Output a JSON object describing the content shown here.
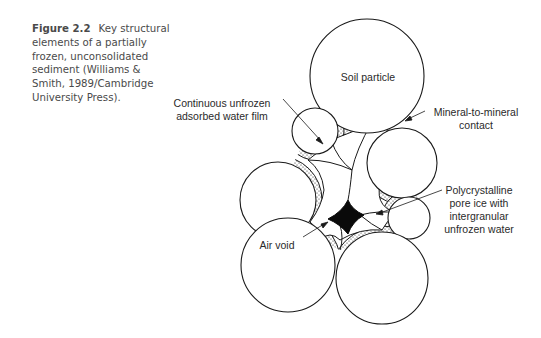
{
  "caption": {
    "figure_label": "Figure 2.2",
    "text": "Key structural elements of a partially frozen, unconsolidated sediment (Williams & Smith, 1989/Cambridge University Press)."
  },
  "diagram": {
    "labels": {
      "soil_particle": "Soil particle",
      "water_film_line1": "Continuous unfrozen",
      "water_film_line2": "adsorbed water film",
      "mineral_contact_line1": "Mineral-to-mineral",
      "mineral_contact_line2": "contact",
      "pore_ice_line1": "Polycrystalline",
      "pore_ice_line2": "pore ice with",
      "pore_ice_line3": "intergranular",
      "pore_ice_line4": "unfrozen water",
      "air_void": "Air void"
    },
    "colors": {
      "stroke": "#1a1a1a",
      "void_fill": "#0a0a0a",
      "caption_text": "#4a4a4a"
    }
  }
}
